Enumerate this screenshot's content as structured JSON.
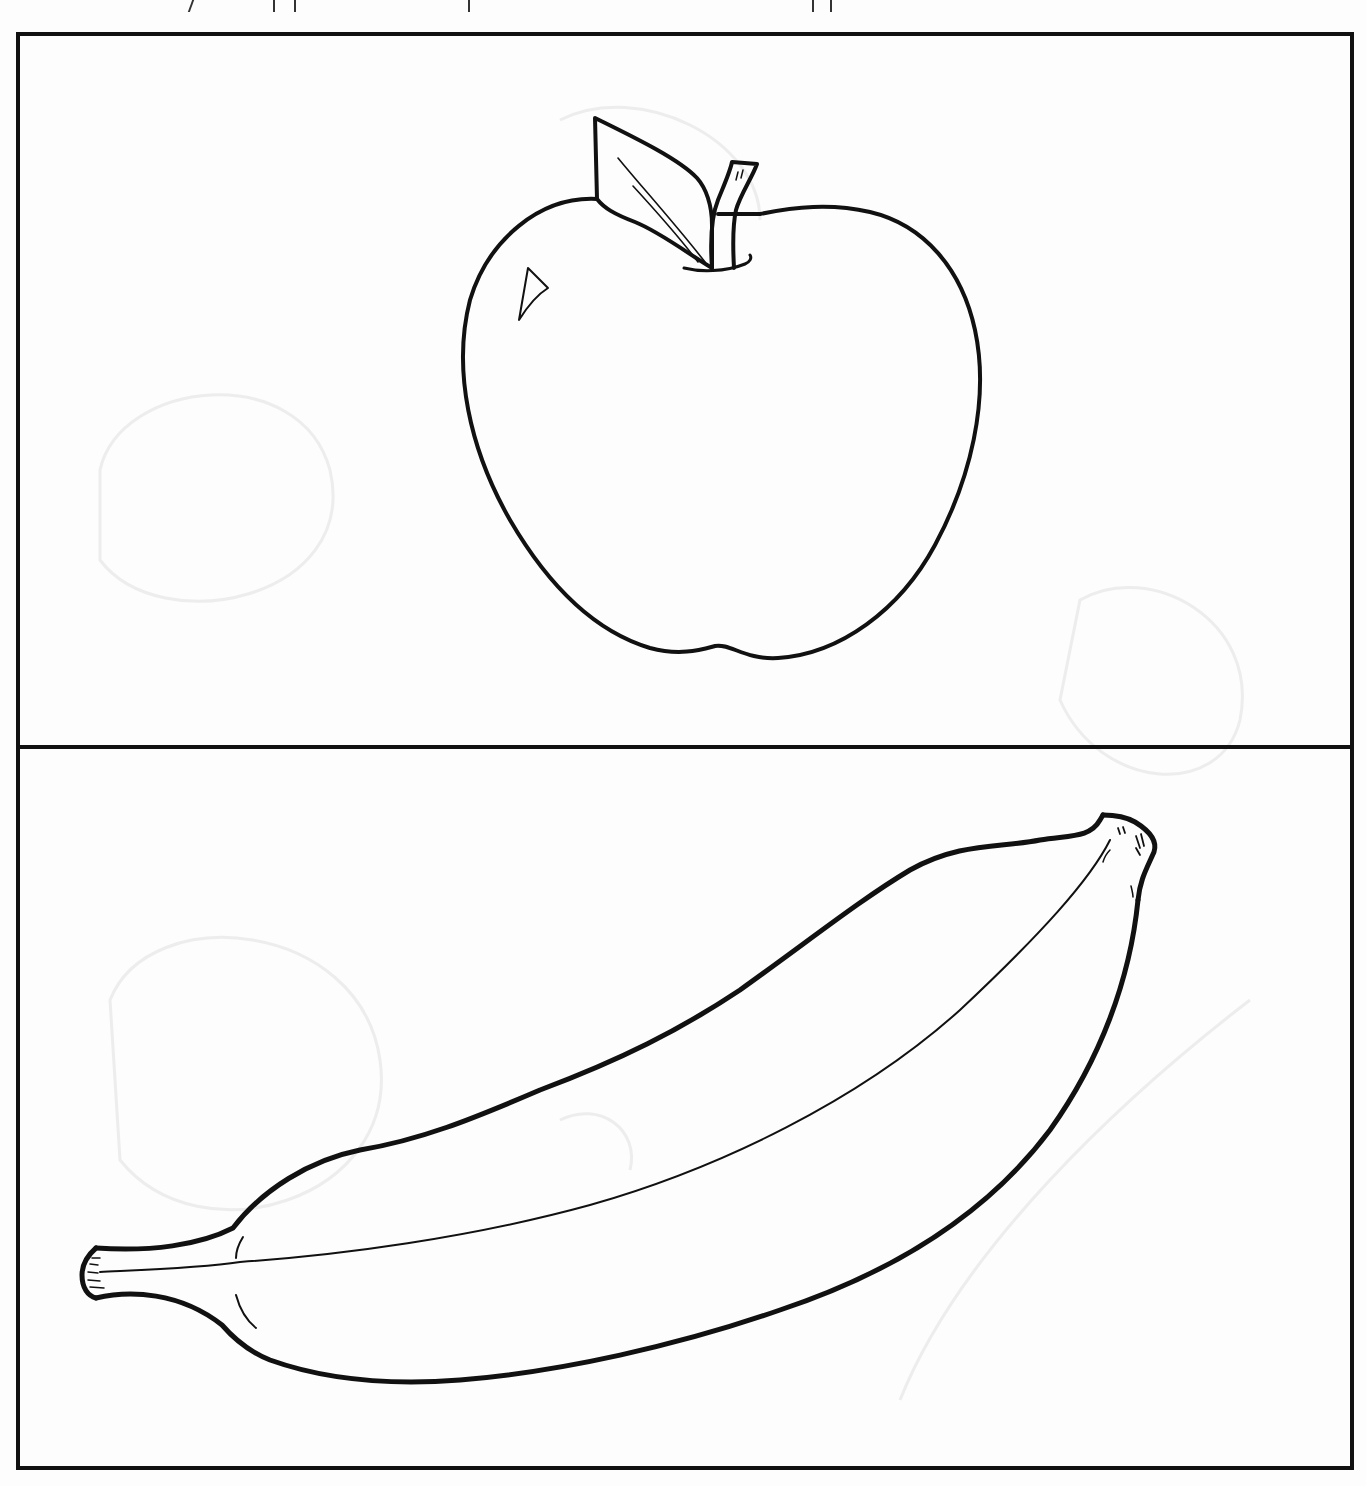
{
  "worksheet": {
    "type": "coloring-page",
    "panels": [
      {
        "id": "top",
        "subject": "apple",
        "label": "Apple"
      },
      {
        "id": "bottom",
        "subject": "banana",
        "label": "Banana"
      }
    ],
    "colors": {
      "ink": "#111111",
      "paper": "#fdfdfd",
      "ghost_bleed": "#bdbdbd"
    },
    "frame": {
      "left": 17,
      "top": 33,
      "right": 1353,
      "bottom": 1469,
      "divider_y": 747
    }
  }
}
